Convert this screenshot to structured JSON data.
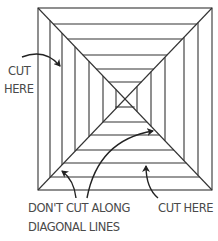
{
  "diagram": {
    "colors": {
      "line": "#333333",
      "text": "#4a4a4a",
      "background": "#ffffff"
    },
    "square": {
      "center": [
        125,
        99
      ],
      "left_x": [
        38,
        50,
        62,
        75,
        89,
        103,
        116
      ],
      "right_x": [
        212,
        198,
        184,
        165,
        151,
        137
      ],
      "top_y": [
        8,
        24,
        39,
        55,
        69,
        82
      ],
      "bottom_y": [
        190,
        177,
        163,
        150,
        135,
        122,
        107
      ]
    },
    "labels": {
      "cut_here_left_line1": "CUT",
      "cut_here_left_line2": "HERE",
      "dont_cut_line1": "DON'T CUT ALONG",
      "dont_cut_line2": "DIAGONAL LINES",
      "cut_here_bottom": "CUT HERE"
    },
    "arrows": [
      {
        "name": "cut-here-left-arrow",
        "from": [
          22,
          57
        ],
        "to": [
          62,
          67
        ]
      },
      {
        "name": "dont-cut-arrow-lower",
        "from": [
          75,
          198
        ],
        "to": [
          61,
          171
        ]
      },
      {
        "name": "dont-cut-arrow-upper",
        "from": [
          87,
          198
        ],
        "to": [
          154,
          131
        ]
      },
      {
        "name": "cut-here-bottom-arrow",
        "from": [
          158,
          198
        ],
        "to": [
          146,
          165
        ]
      }
    ]
  }
}
